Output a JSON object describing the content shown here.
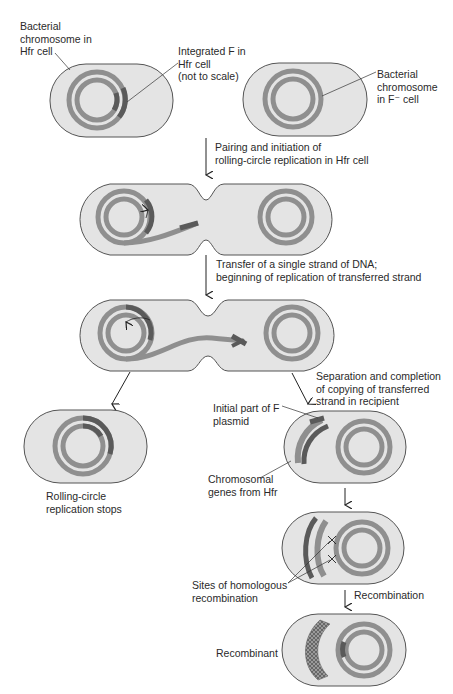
{
  "colors": {
    "cell_fill": "#e4e4e4",
    "cell_stroke": "#555555",
    "chromosome": "#8f8f8f",
    "f_factor": "#5a5a5a",
    "text": "#2a2a2a"
  },
  "labels": {
    "hfr_chromosome": [
      "Bacterial",
      "chromosome in",
      "Hfr cell"
    ],
    "integrated_f": [
      "Integrated F in",
      "Hfr cell",
      "(not to scale)"
    ],
    "fminus_chromosome": [
      "Bacterial",
      "chromosome",
      "in F⁻ cell"
    ],
    "step1": [
      "Pairing and initiation of",
      "rolling-circle replication in Hfr cell"
    ],
    "step2": [
      "Transfer of a single strand of DNA;",
      "beginning of replication of transferred strand"
    ],
    "step3": [
      "Separation and completion",
      "of copying of transferred",
      "strand in recipient"
    ],
    "rolling_stops": [
      "Rolling-circle",
      "replication stops"
    ],
    "initial_f": [
      "Initial part of F",
      "plasmid"
    ],
    "chromosomal_genes": [
      "Chromosomal",
      "genes from Hfr"
    ],
    "recomb_sites": [
      "Sites of homologous",
      "recombination"
    ],
    "recombination": "Recombination",
    "recombinant": "Recombinant"
  }
}
